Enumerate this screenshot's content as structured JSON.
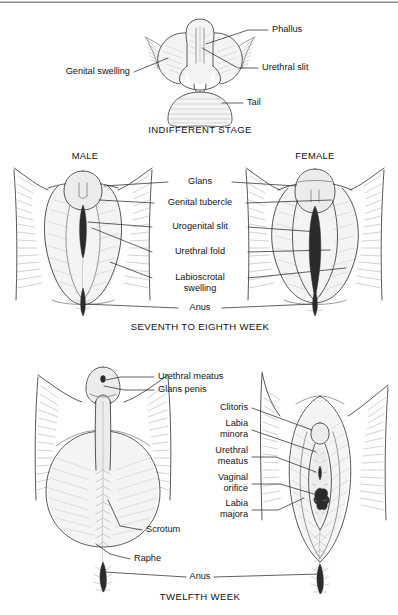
{
  "document": {
    "title": "Development of the External Genitalia",
    "type": "anatomical-illustration",
    "panel_count": 3
  },
  "top_rule": {
    "present": true
  },
  "panels": [
    {
      "id": "indifferent-stage",
      "caption": "INDIFFERENT STAGE",
      "caption_x": 200,
      "caption_y": 130,
      "figures": [],
      "labels": [
        {
          "id": "phallus",
          "text": "Phallus",
          "x": 272,
          "y": 30,
          "anchor": "start"
        },
        {
          "id": "urethral-slit",
          "text": "Urethral slit",
          "x": 262,
          "y": 68,
          "anchor": "start"
        },
        {
          "id": "genital-swelling",
          "text": "Genital swelling",
          "x": 130,
          "y": 72,
          "anchor": "end"
        },
        {
          "id": "tail",
          "text": "Tail",
          "x": 247,
          "y": 103,
          "anchor": "start"
        }
      ]
    },
    {
      "id": "seventh-to-eighth-week",
      "caption": "SEVENTH TO EIGHTH WEEK",
      "caption_x": 200,
      "caption_y": 327,
      "headings": [
        {
          "id": "male",
          "text": "MALE",
          "x": 85,
          "y": 157
        },
        {
          "id": "female",
          "text": "FEMALE",
          "x": 315,
          "y": 157
        }
      ],
      "labels": [
        {
          "id": "glans",
          "text": "Glans",
          "x": 200,
          "y": 182,
          "anchor": "middle"
        },
        {
          "id": "genital-tubercle",
          "text": "Genital tubercle",
          "x": 200,
          "y": 203,
          "anchor": "middle"
        },
        {
          "id": "urogenital-slit",
          "text": "Urogenital slit",
          "x": 200,
          "y": 227,
          "anchor": "middle"
        },
        {
          "id": "urethral-fold",
          "text": "Urethral fold",
          "x": 200,
          "y": 252,
          "anchor": "middle"
        },
        {
          "id": "labioscrotal-1",
          "text": "Labioscrotal",
          "x": 200,
          "y": 278,
          "anchor": "middle"
        },
        {
          "id": "labioscrotal-2",
          "text": "swelling",
          "x": 200,
          "y": 289,
          "anchor": "middle"
        },
        {
          "id": "anus-mid",
          "text": "Anus",
          "x": 200,
          "y": 308,
          "anchor": "middle"
        }
      ]
    },
    {
      "id": "twelfth-week",
      "caption": "TWELFTH WEEK",
      "caption_x": 200,
      "caption_y": 597,
      "labels": [
        {
          "id": "urethral-meatus-male",
          "text": "Urethral meatus",
          "x": 158,
          "y": 377,
          "anchor": "start"
        },
        {
          "id": "glans-penis",
          "text": "Glans penis",
          "x": 158,
          "y": 390,
          "anchor": "start"
        },
        {
          "id": "clitoris",
          "text": "Clitoris",
          "x": 248,
          "y": 408,
          "anchor": "end"
        },
        {
          "id": "labia-minora-1",
          "text": "Labia",
          "x": 248,
          "y": 424,
          "anchor": "end"
        },
        {
          "id": "labia-minora-2",
          "text": "minora",
          "x": 248,
          "y": 435,
          "anchor": "end"
        },
        {
          "id": "urethral-meatus-f-1",
          "text": "Urethral",
          "x": 248,
          "y": 451,
          "anchor": "end"
        },
        {
          "id": "urethral-meatus-f-2",
          "text": "meatus",
          "x": 248,
          "y": 462,
          "anchor": "end"
        },
        {
          "id": "vaginal-orifice-1",
          "text": "Vaginal",
          "x": 248,
          "y": 478,
          "anchor": "end"
        },
        {
          "id": "vaginal-orifice-2",
          "text": "orifice",
          "x": 248,
          "y": 489,
          "anchor": "end"
        },
        {
          "id": "labia-majora-1",
          "text": "Labia",
          "x": 248,
          "y": 504,
          "anchor": "end"
        },
        {
          "id": "labia-majora-2",
          "text": "majora",
          "x": 248,
          "y": 515,
          "anchor": "end"
        },
        {
          "id": "scrotum",
          "text": "Scrotum",
          "x": 146,
          "y": 530,
          "anchor": "start"
        },
        {
          "id": "raphe",
          "text": "Raphe",
          "x": 134,
          "y": 559,
          "anchor": "start"
        },
        {
          "id": "anus-bottom",
          "text": "Anus",
          "x": 200,
          "y": 577,
          "anchor": "middle"
        }
      ]
    }
  ],
  "colors": {
    "background": "#ffffff",
    "outline": "#3a3a3a",
    "hatch": "#9b9b9b",
    "leader": "#2d2d2d",
    "dark_slit": "#2b2b2b",
    "text": "#141414",
    "rule": "#8c8c8c"
  }
}
